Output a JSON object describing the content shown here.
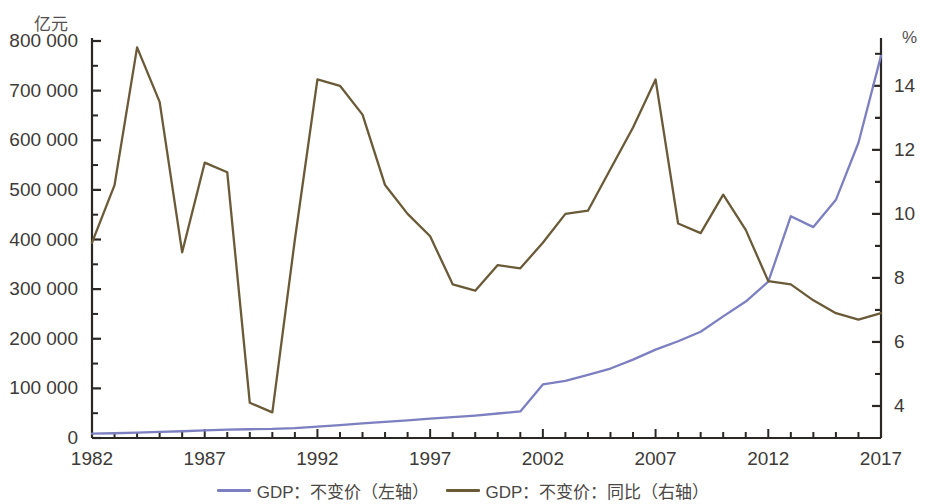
{
  "axes": {
    "left_unit": "亿元",
    "right_unit": "%",
    "left_ticks": [
      "0",
      "100 000",
      "200 000",
      "300 000",
      "400 000",
      "500 000",
      "600 000",
      "700 000",
      "800 000"
    ],
    "right_ticks": [
      "4",
      "6",
      "8",
      "10",
      "12",
      "14"
    ],
    "x_ticks": [
      "1982",
      "1987",
      "1992",
      "1997",
      "2002",
      "2007",
      "2012",
      "2017"
    ]
  },
  "legend": {
    "items": [
      {
        "label": "GDP：不变价（左轴）",
        "color": "#7c7fc0"
      },
      {
        "label": "GDP：不变价：同比（右轴）",
        "color": "#6a5a38"
      }
    ]
  },
  "chart_data": {
    "type": "line",
    "title": "",
    "xlabel": "",
    "ylabel": "亿元",
    "y2label": "%",
    "xlim": [
      1982,
      2017
    ],
    "ylim": [
      0,
      800000
    ],
    "y2lim": [
      3.0,
      15.4
    ],
    "grid": false,
    "legend_position": "bottom",
    "x": [
      1982,
      1983,
      1984,
      1985,
      1986,
      1987,
      1988,
      1989,
      1990,
      1991,
      1992,
      1993,
      1994,
      1995,
      1996,
      1997,
      1998,
      1999,
      2000,
      2001,
      2002,
      2003,
      2004,
      2005,
      2006,
      2007,
      2008,
      2009,
      2010,
      2011,
      2012,
      2013,
      2014,
      2015,
      2016,
      2017
    ],
    "series": [
      {
        "name": "GDP：不变价（左轴）",
        "axis": "left",
        "unit": "亿元",
        "color": "#7c7fc0",
        "values": [
          8630,
          9550,
          11000,
          12500,
          13600,
          15200,
          16900,
          17600,
          18300,
          20000,
          22800,
          25900,
          29300,
          32500,
          35700,
          39000,
          42000,
          45200,
          49400,
          53500,
          108000,
          115000,
          127000,
          140000,
          158000,
          178000,
          195000,
          214000,
          245000,
          275000,
          315000,
          447000,
          425000,
          480000,
          595000,
          770000
        ]
      },
      {
        "name": "GDP：不变价：同比（右轴）",
        "axis": "right",
        "unit": "%",
        "color": "#6a5a38",
        "values": [
          9.1,
          10.9,
          15.2,
          13.5,
          8.8,
          11.6,
          11.3,
          4.1,
          3.8,
          9.2,
          14.2,
          14.0,
          13.1,
          10.9,
          10.0,
          9.3,
          7.8,
          7.6,
          8.4,
          8.3,
          9.1,
          10.0,
          10.1,
          11.4,
          12.7,
          14.2,
          9.7,
          9.4,
          10.6,
          9.5,
          7.9,
          7.8,
          7.3,
          6.9,
          6.7,
          6.9
        ]
      }
    ]
  }
}
